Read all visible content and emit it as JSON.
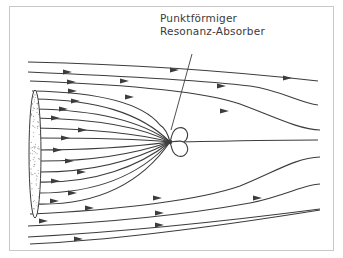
{
  "diagram": {
    "label_line1": "Punktförmiger",
    "label_line2": "Resonanz-Absorber",
    "colors": {
      "line": "#3c3c3c",
      "frame": "#c8c8c8",
      "dots": "#9a9a9a"
    },
    "absorber_center": [
      170,
      142
    ],
    "streamlines": [
      {
        "d": "M28,62 C120,64 220,70 318,81",
        "arrows": [
          [
            175,
            70
          ],
          [
            288,
            78
          ]
        ]
      },
      {
        "d": "M28,72 C120,76 200,80 250,86 C280,90 300,103 318,105",
        "arrows": [
          [
            68,
            72
          ],
          [
            125,
            81
          ],
          [
            222,
            86
          ]
        ]
      },
      {
        "d": "M30,81 C110,84 200,90 240,104 C270,115 300,130 320,130",
        "arrows": [
          [
            72,
            82
          ],
          [
            130,
            97
          ],
          [
            225,
            111
          ]
        ]
      },
      {
        "d": "M32,91 C90,92 140,100 160,125 C165,128 168,134 170,142",
        "arrows": [
          [
            73,
            91
          ]
        ]
      },
      {
        "d": "M34,99 C95,100 140,112 170,142",
        "arrows": [
          [
            76,
            101
          ]
        ]
      },
      {
        "d": "M34,109 C95,110 140,120 170,142",
        "arrows": [
          [
            64,
            109
          ]
        ]
      },
      {
        "d": "M34,118 C95,119 140,126 170,142",
        "arrows": [
          [
            56,
            118
          ]
        ]
      },
      {
        "d": "M34,128 C95,129 140,134 170,142",
        "arrows": [
          [
            83,
            130
          ]
        ]
      },
      {
        "d": "M34,138 C95,138 140,139 170,142",
        "arrows": [
          [
            66,
            138
          ]
        ]
      },
      {
        "d": "M34,150 C95,150 140,146 170,142",
        "arrows": [
          [
            58,
            150
          ]
        ]
      },
      {
        "d": "M34,161 C95,162 140,152 170,142",
        "arrows": [
          [
            70,
            161
          ]
        ]
      },
      {
        "d": "M34,172 C95,173 140,158 170,142",
        "arrows": [
          [
            82,
            172
          ]
        ]
      },
      {
        "d": "M34,182 C95,184 140,166 170,142",
        "arrows": [
          [
            56,
            181
          ]
        ]
      },
      {
        "d": "M34,193 C95,194 140,175 170,142",
        "arrows": [
          [
            73,
            193
          ]
        ]
      },
      {
        "d": "M34,204 C95,206 140,185 170,142",
        "arrows": [
          [
            55,
            201
          ]
        ]
      },
      {
        "d": "M30,214 C120,210 200,200 240,186 C275,172 295,158 320,157",
        "arrows": [
          [
            90,
            208
          ],
          [
            158,
            198
          ]
        ]
      },
      {
        "d": "M28,226 C120,222 200,212 250,203 C285,196 305,184 320,184",
        "arrows": [
          [
            44,
            221
          ],
          [
            160,
            213
          ],
          [
            258,
            198
          ]
        ]
      },
      {
        "d": "M28,237 C120,232 220,222 320,209",
        "arrows": [
          [
            79,
            239
          ],
          [
            160,
            225
          ]
        ]
      },
      {
        "d": "M30,244 C120,240 220,226 320,210",
        "arrows": []
      },
      {
        "d": "M170,142 C230,141 280,140 318,140",
        "arrows": []
      }
    ],
    "leader_line": {
      "x1": 192,
      "y1": 54,
      "x2": 171,
      "y2": 130
    }
  }
}
